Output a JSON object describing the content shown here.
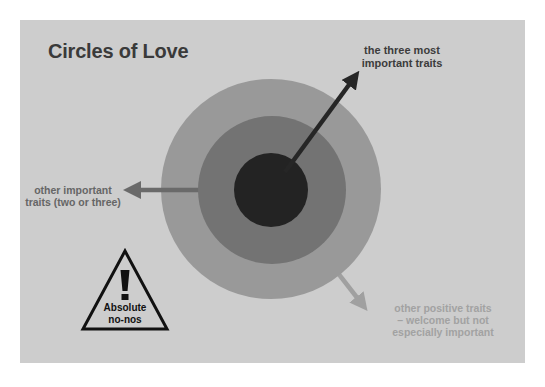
{
  "title": "Circles of Love",
  "colors": {
    "page_background": "#ffffff",
    "panel": "#cdcdcd",
    "outer_ring": "#999999",
    "middle_ring": "#737373",
    "inner_core": "#232323",
    "arrow_inner": "#262626",
    "arrow_middle": "#6a6a6a",
    "arrow_outer": "#a0a0a0",
    "warning_triangle": "#111111"
  },
  "circles": [
    {
      "name": "outer",
      "meaning": "other positive traits – welcome but not especially important"
    },
    {
      "name": "middle",
      "meaning": "other important traits (two or three)"
    },
    {
      "name": "inner",
      "meaning": "the three most important traits"
    }
  ],
  "labels": {
    "inner": [
      "the three most",
      "important traits"
    ],
    "middle": [
      "other important",
      "traits (two or three)"
    ],
    "outer": [
      "other positive traits",
      "– welcome but not",
      "especially important"
    ]
  },
  "warning": {
    "icon": "exclamation-triangle-icon",
    "symbol": "!",
    "lines": [
      "Absolute",
      "no-nos"
    ]
  }
}
